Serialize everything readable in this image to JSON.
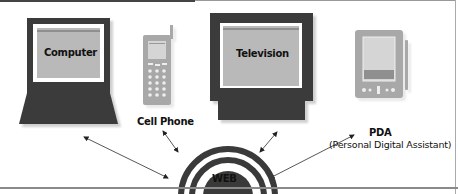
{
  "diagram": {
    "type": "hub-and-spoke",
    "hub": {
      "label": "WEB"
    },
    "devices": [
      {
        "id": "computer",
        "label": "Computer",
        "icon": "laptop-icon"
      },
      {
        "id": "cell-phone",
        "label": "Cell Phone",
        "icon": "cell-phone-icon"
      },
      {
        "id": "television",
        "label": "Television",
        "icon": "television-icon"
      },
      {
        "id": "pda",
        "label": "PDA",
        "sublabel": "(Personal Digital Assistant)",
        "icon": "pda-icon"
      }
    ],
    "connections": [
      {
        "from": "computer",
        "to": "WEB",
        "style": "double-arrow"
      },
      {
        "from": "cell-phone",
        "to": "WEB",
        "style": "double-arrow"
      },
      {
        "from": "television",
        "to": "WEB",
        "style": "double-arrow"
      },
      {
        "from": "pda",
        "to": "WEB",
        "style": "double-arrow"
      }
    ],
    "colors": {
      "dark": "#3a3a3a",
      "screen": "#b9b9b9",
      "device_gray": "#a8a8a8",
      "line": "#555555"
    }
  }
}
